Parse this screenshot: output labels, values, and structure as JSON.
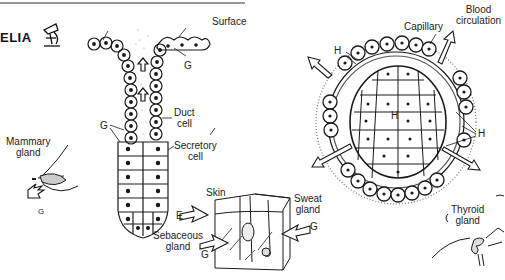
{
  "figure": {
    "title_fragment": "ELIA",
    "title_icon": "microscope-icon",
    "colors": {
      "ink": "#1a1a1a",
      "rule": "#777777",
      "background": "#ffffff"
    }
  },
  "exocrine": {
    "surface_label": "Surface",
    "g_labels": [
      "G",
      "G"
    ],
    "duct_cell_label": [
      "Duct",
      "cell"
    ],
    "secretory_cell_label": [
      "Secretory",
      "cell"
    ],
    "mammary": {
      "label": [
        "Mammary",
        "gland"
      ],
      "g": "G"
    },
    "skin": {
      "skin_label": "Skin",
      "sweat_label": [
        "Sweat",
        "gland"
      ],
      "sebaceous_label": [
        "Sebaceous",
        "gland"
      ],
      "e_label": "E",
      "g_sweat": "G",
      "g_sebaceous": "G"
    }
  },
  "endocrine": {
    "capillary_label": "Capillary",
    "blood_label": [
      "Blood",
      "circulation"
    ],
    "h_labels": [
      "H",
      "H",
      "H"
    ],
    "thyroid_label": [
      "Thyroid",
      "gland"
    ]
  }
}
